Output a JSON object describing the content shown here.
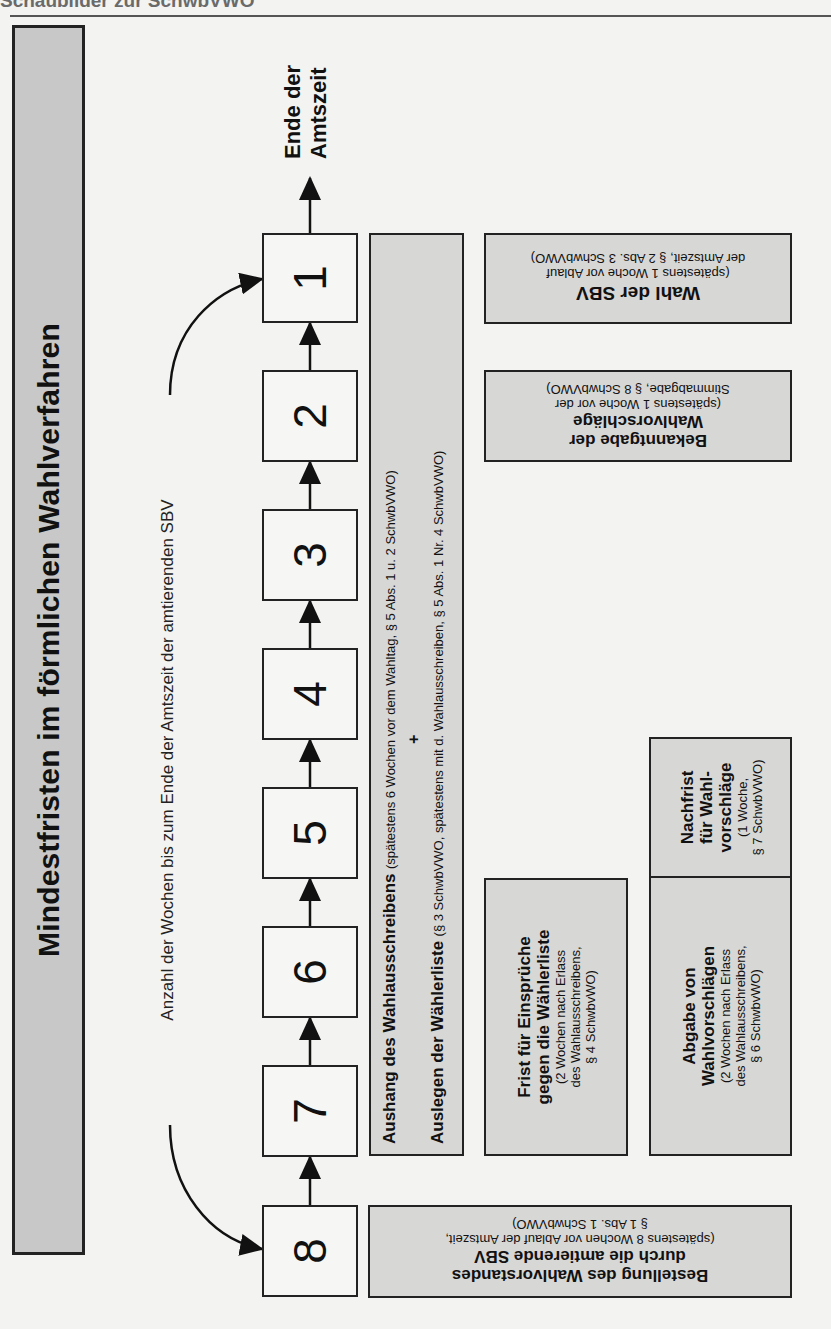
{
  "page": {
    "header": "Schaubilder zur SchwbVWO"
  },
  "diagram": {
    "title": "Mindestfristen im förmlichen Wahlverfahren",
    "annotation": "Anzahl der Wochen bis zum Ende der Amtszeit der amtierenden SBV",
    "end_label_line1": "Ende der",
    "end_label_line2": "Amtszeit",
    "week_boxes": [
      "8",
      "7",
      "6",
      "5",
      "4",
      "3",
      "2",
      "1"
    ],
    "aushang": {
      "title": "Aushang des Wahlausschreibens",
      "ref": "(spätestens 6 Wochen vor dem Wahltag, § 5 Abs. 1 u. 2 SchwbVWO)",
      "plus": "+",
      "title2": "Auslegen der Wählerliste",
      "ref2": "(§ 3 SchwbVWO, spätestens mit d. Wahlausschreiben, § 5 Abs. 1 Nr. 4 SchwbVWO)"
    },
    "bestellung": {
      "line1": "Bestellung des Wahlvorstandes",
      "line2": "durch die amtierende SBV",
      "line3": "(spätestens 8 Wochen vor Ablauf der Amtszeit,",
      "line4": "§ 1 Abs. 1 SchwbVWO)"
    },
    "frist": {
      "line1": "Frist für Einsprüche",
      "line2": "gegen die Wählerliste",
      "line3": "(2 Wochen nach Erlass",
      "line4": "des Wahlausschreibens,",
      "line5": "§ 4 SchwbvWO)"
    },
    "abgabe": {
      "line1": "Abgabe von",
      "line2": "Wahlvorschlägen",
      "line3": "(2 Wochen nach Erlass",
      "line4": "des Wahlausschreibens,",
      "line5": "§ 6 SchwbvWO)"
    },
    "nachfrist": {
      "line1": "Nachfrist",
      "line2": "für Wahl-",
      "line3": "vorschläge",
      "line4": "(1 Woche,",
      "line5": "§ 7 SchwbVWO)"
    },
    "bekanntgabe": {
      "line1": "Bekanntgabe der",
      "line2": "Wahlvorschläge",
      "line3": "(spätestens 1 Woche vor der",
      "line4": "Stimmabgabe, § 8 SchwbVWO)"
    },
    "wahl": {
      "line1": "Wahl der SBV",
      "line2": "(spätestens 1 Woche vor Ablauf",
      "line3": "der Amtszeit, § 2 Abs. 3 SchwbVWO)"
    }
  },
  "colors": {
    "box_fill": "#d7d7d5",
    "title_fill": "#c8c8c8",
    "stroke": "#222222",
    "background": "#f3f3f1"
  }
}
